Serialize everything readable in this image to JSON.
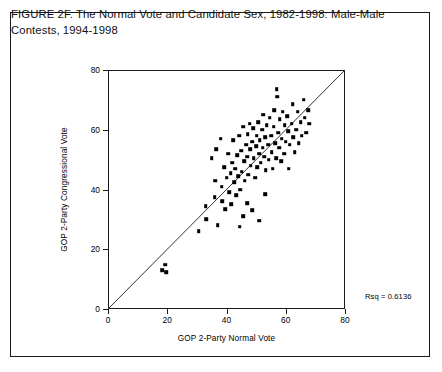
{
  "figure": {
    "caption": "FIGURE 2F. The Normal Vote and Candidate Sex, 1982-1998: Male-Male Contests, 1994-1998"
  },
  "chart_data": {
    "type": "scatter",
    "title": "",
    "xlabel": "GOP 2-Party Normal Vote",
    "ylabel": "GOP 2-Party Congressional Vote",
    "xlim": [
      0,
      80
    ],
    "ylim": [
      0,
      80
    ],
    "xticks": [
      0,
      20,
      40,
      60,
      80
    ],
    "yticks": [
      0,
      20,
      40,
      60,
      80
    ],
    "grid": false,
    "legend": null,
    "annotations": [
      {
        "name": "rsq",
        "text": "Rsq = 0.6136",
        "value": 0.6136
      }
    ],
    "reference_line": {
      "name": "identity-line",
      "from": [
        0,
        0
      ],
      "to": [
        80,
        80
      ],
      "style": "solid",
      "color": "#333333"
    },
    "points": [
      [
        18.2,
        13.0
      ],
      [
        19.4,
        14.8
      ],
      [
        19.6,
        12.4
      ],
      [
        30.6,
        26.0
      ],
      [
        33.0,
        34.5
      ],
      [
        33.2,
        30.0
      ],
      [
        36.0,
        37.5
      ],
      [
        36.2,
        43.0
      ],
      [
        37.0,
        28.0
      ],
      [
        38.4,
        41.0
      ],
      [
        38.6,
        36.0
      ],
      [
        39.2,
        47.5
      ],
      [
        39.6,
        33.5
      ],
      [
        40.0,
        44.0
      ],
      [
        40.6,
        52.0
      ],
      [
        41.0,
        39.0
      ],
      [
        41.4,
        45.5
      ],
      [
        41.6,
        35.0
      ],
      [
        42.0,
        49.0
      ],
      [
        42.2,
        56.5
      ],
      [
        42.6,
        42.5
      ],
      [
        43.0,
        47.0
      ],
      [
        43.2,
        38.0
      ],
      [
        43.6,
        51.5
      ],
      [
        44.0,
        44.5
      ],
      [
        44.2,
        58.0
      ],
      [
        44.6,
        40.0
      ],
      [
        45.0,
        53.0
      ],
      [
        45.2,
        46.0
      ],
      [
        45.6,
        61.0
      ],
      [
        46.0,
        49.5
      ],
      [
        46.2,
        43.0
      ],
      [
        46.6,
        55.0
      ],
      [
        47.0,
        51.0
      ],
      [
        47.2,
        58.5
      ],
      [
        47.4,
        45.0
      ],
      [
        47.8,
        62.0
      ],
      [
        48.0,
        53.5
      ],
      [
        48.2,
        48.0
      ],
      [
        48.6,
        56.0
      ],
      [
        49.0,
        60.5
      ],
      [
        49.2,
        50.5
      ],
      [
        49.6,
        44.0
      ],
      [
        50.0,
        54.5
      ],
      [
        50.2,
        58.0
      ],
      [
        50.4,
        47.5
      ],
      [
        50.8,
        62.5
      ],
      [
        51.0,
        52.0
      ],
      [
        51.2,
        56.5
      ],
      [
        51.6,
        49.0
      ],
      [
        52.0,
        60.0
      ],
      [
        52.2,
        54.0
      ],
      [
        52.4,
        65.0
      ],
      [
        52.8,
        51.0
      ],
      [
        53.0,
        57.5
      ],
      [
        53.2,
        46.5
      ],
      [
        53.6,
        61.5
      ],
      [
        54.0,
        55.0
      ],
      [
        54.2,
        50.0
      ],
      [
        54.6,
        64.0
      ],
      [
        55.0,
        58.0
      ],
      [
        55.2,
        52.5
      ],
      [
        55.6,
        47.0
      ],
      [
        56.0,
        61.0
      ],
      [
        56.2,
        66.5
      ],
      [
        56.4,
        55.5
      ],
      [
        56.8,
        50.5
      ],
      [
        57.0,
        73.5
      ],
      [
        57.2,
        71.0
      ],
      [
        57.4,
        59.0
      ],
      [
        57.8,
        54.0
      ],
      [
        58.0,
        63.5
      ],
      [
        58.4,
        49.5
      ],
      [
        58.6,
        57.0
      ],
      [
        59.0,
        66.0
      ],
      [
        59.4,
        52.0
      ],
      [
        59.6,
        61.5
      ],
      [
        60.0,
        56.0
      ],
      [
        60.4,
        64.5
      ],
      [
        60.8,
        59.5
      ],
      [
        61.0,
        47.0
      ],
      [
        61.4,
        55.0
      ],
      [
        62.0,
        62.0
      ],
      [
        62.4,
        68.5
      ],
      [
        62.6,
        57.5
      ],
      [
        63.0,
        52.5
      ],
      [
        63.6,
        60.0
      ],
      [
        64.0,
        66.0
      ],
      [
        64.4,
        55.5
      ],
      [
        65.0,
        62.5
      ],
      [
        65.4,
        58.0
      ],
      [
        66.0,
        70.0
      ],
      [
        66.4,
        64.0
      ],
      [
        67.0,
        59.0
      ],
      [
        67.6,
        66.5
      ],
      [
        68.0,
        62.0
      ],
      [
        44.4,
        27.5
      ],
      [
        45.6,
        31.0
      ],
      [
        47.0,
        35.5
      ],
      [
        48.6,
        33.0
      ],
      [
        51.0,
        29.5
      ],
      [
        53.0,
        38.5
      ],
      [
        35.0,
        50.5
      ],
      [
        36.6,
        53.5
      ],
      [
        38.0,
        57.0
      ]
    ]
  }
}
